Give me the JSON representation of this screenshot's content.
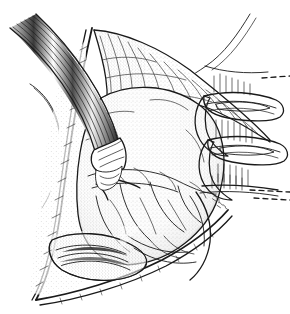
{
  "figure": {
    "title": "Surgical exposure line illustration",
    "medium": "pen-and-ink stipple drawing",
    "background_color": "#ffffff",
    "ink_color": "#1a1a1a",
    "width": 290,
    "height": 314,
    "artist_signature": "",
    "caption": "",
    "labels": []
  },
  "elements": {
    "nerve_bundle": {
      "name": "Striated cable / nerve-vessel bundle",
      "description": "Multi-stranded banded bundle entering from upper-left, running diagonally down-right, terminating in a cuffed tip at center-left",
      "stroke_count": 7,
      "accent_color": "#1a1a1a"
    },
    "tissue_flap_upper": {
      "name": "Upper fascial flap",
      "description": "Stippled triangular tissue flap retracted upward across the top of the field"
    },
    "central_mass": {
      "name": "Central exposed mass",
      "description": "Large rounded stippled structure occupying the middle of the operative field"
    },
    "wound_edge": {
      "name": "Wound margin",
      "description": "Long curving incised skin edge sweeping from upper-left down to the lower pointed apex"
    },
    "retractor_bands": {
      "name": "Retractor bands",
      "count": 2,
      "description": "Two flat looped retractor blades engaging tissue at the right border"
    },
    "deep_recess": {
      "name": "Deep recess",
      "description": "Dark shaded pocket at the lower portion of the exposure"
    },
    "continuation_marks": {
      "name": "Dashed continuation lines",
      "description": "Short dashed strokes at the right margin indicating the drawing continues off-frame",
      "count": 3
    }
  },
  "palette": {
    "paper": "#ffffff",
    "line": "#1a1a1a",
    "mid_tone": "#6b6b6b",
    "light_tone": "#bdbdbd"
  }
}
